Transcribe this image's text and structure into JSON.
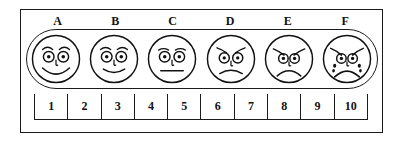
{
  "figure": {
    "title": "Faces Pain Rating Scale",
    "frame_color": "#1b1b1b",
    "background_color": "#ffffff",
    "ink_color": "#111111"
  },
  "faces": {
    "labels": [
      "A",
      "B",
      "C",
      "D",
      "E",
      "F"
    ],
    "items": [
      {
        "label": "A",
        "expression": "big-smile",
        "icon": "face-big-smile-icon",
        "description": "Broad smiling face, raised eyebrows, no tears"
      },
      {
        "label": "B",
        "expression": "slight-smile",
        "icon": "face-slight-smile-icon",
        "description": "Mildly smiling face, raised eyebrows, no tears"
      },
      {
        "label": "C",
        "expression": "neutral",
        "icon": "face-neutral-icon",
        "description": "Neutral face with straight mouth"
      },
      {
        "label": "D",
        "expression": "slight-frown",
        "icon": "face-slight-frown-icon",
        "description": "Slightly frowning face, worried eyebrows"
      },
      {
        "label": "E",
        "expression": "frown",
        "icon": "face-frown-icon",
        "description": "Frowning sad face, sloped eyebrows"
      },
      {
        "label": "F",
        "expression": "crying",
        "icon": "face-crying-icon",
        "description": "Crying face with deep frown and tear drops"
      }
    ]
  },
  "number_scale": {
    "values": [
      "1",
      "2",
      "3",
      "4",
      "5",
      "6",
      "7",
      "8",
      "9",
      "10"
    ],
    "min": 1,
    "max": 10
  }
}
